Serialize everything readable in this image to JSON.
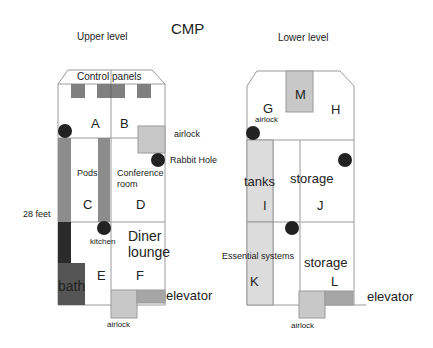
{
  "title": "CMP",
  "upper": {
    "heading": "Upper level",
    "control_panels": "Control panels",
    "rooms": {
      "A": "A",
      "B": "B",
      "C": "C",
      "D": "D",
      "E": "E",
      "F": "F"
    },
    "labels": {
      "airlock_side": "airlock",
      "rabbit_hole": "Rabbit Hole",
      "pods": "Pods",
      "conference": "Conference",
      "conference_room": "room",
      "height": "28 feet",
      "kitchen": "kitchen",
      "diner": "Diner",
      "lounge": "lounge",
      "bath": "bath",
      "elevator": "elevator",
      "airlock_bottom": "airlock"
    }
  },
  "lower": {
    "heading": "Lower level",
    "rooms": {
      "G": "G",
      "H": "H",
      "I": "I",
      "J": "J",
      "K": "K",
      "L": "L",
      "M": "M"
    },
    "labels": {
      "airlock_top": "airlock",
      "tanks": "tanks",
      "storage_upper": "storage",
      "essential": "Essential systems",
      "storage_lower": "storage",
      "elevator": "elevator",
      "airlock_bottom": "airlock"
    }
  },
  "colors": {
    "outline": "#9a9a9a",
    "panel_grey": "#808080",
    "pod_grey": "#8c8c8c",
    "dark": "#2b2b2b",
    "bath": "#555555",
    "light_grey": "#c8c8c8",
    "tank_grey": "#dcdcdc",
    "elevator_grey": "#a6a6a6",
    "hatch": "#222222"
  }
}
